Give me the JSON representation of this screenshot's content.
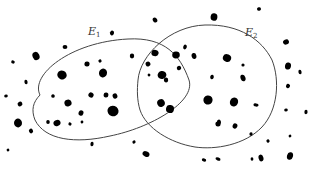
{
  "diagram": {
    "type": "venn-scatter",
    "sets": [
      {
        "id": "E1",
        "label_main": "E",
        "label_sub": "1",
        "label_pos": [
          88,
          26
        ]
      },
      {
        "id": "E2",
        "label_main": "E",
        "label_sub": "2",
        "label_pos": [
          245,
          27
        ]
      }
    ],
    "colors": {
      "background": "#ffffff",
      "curve": "#444444",
      "dot": "#000000",
      "label": "#333333"
    },
    "dots": [
      [
        155,
        20,
        2.2,
        2.6
      ],
      [
        214,
        17,
        3.4,
        3.8
      ],
      [
        259,
        9,
        2,
        1.8
      ],
      [
        112,
        33,
        2,
        2.4
      ],
      [
        65,
        47,
        2.4,
        2.0
      ],
      [
        36,
        56,
        3.4,
        4.2
      ],
      [
        13,
        62,
        1.8,
        1.6
      ],
      [
        26,
        82,
        1.6,
        2.2
      ],
      [
        62,
        75,
        4.8,
        4.4
      ],
      [
        87,
        64,
        2.6,
        2.6
      ],
      [
        100,
        61,
        1.6,
        1.6
      ],
      [
        103,
        73,
        4,
        4.4
      ],
      [
        6,
        96,
        1.8,
        1.6
      ],
      [
        20,
        104,
        2.4,
        2.4
      ],
      [
        53,
        96,
        1.8,
        1.8
      ],
      [
        68,
        103,
        3.6,
        3.4
      ],
      [
        81,
        113,
        2.4,
        2.8
      ],
      [
        48,
        122,
        1.8,
        2.0
      ],
      [
        57,
        123,
        3.6,
        3.0
      ],
      [
        70,
        124,
        1.6,
        1.6
      ],
      [
        82,
        122,
        1.4,
        1.4
      ],
      [
        91,
        95,
        2.6,
        2.6
      ],
      [
        106,
        95,
        2.4,
        2.6
      ],
      [
        115,
        96,
        2.4,
        2.6
      ],
      [
        113,
        111,
        5.6,
        5.2
      ],
      [
        18,
        123,
        4,
        4.4
      ],
      [
        31,
        131,
        2,
        2.4
      ],
      [
        92,
        144,
        1.6,
        2.2
      ],
      [
        134,
        142,
        1.6,
        1.6
      ],
      [
        146,
        154,
        3.6,
        2.6
      ],
      [
        132,
        56,
        2.2,
        2.4
      ],
      [
        148,
        64,
        2.4,
        2.4
      ],
      [
        155,
        53,
        3.6,
        3.2
      ],
      [
        162,
        75,
        4.4,
        4.0
      ],
      [
        149,
        75,
        1.4,
        1.4
      ],
      [
        166,
        80,
        2.2,
        2.4
      ],
      [
        179,
        68,
        2.2,
        2.2
      ],
      [
        185,
        47,
        1.8,
        2.4
      ],
      [
        176,
        55,
        3.8,
        3.4
      ],
      [
        161,
        103,
        3.8,
        3.8
      ],
      [
        170,
        109,
        4,
        4.0
      ],
      [
        194,
        56,
        2.4,
        3.0
      ],
      [
        227,
        58,
        4.2,
        3.8
      ],
      [
        243,
        65,
        1.6,
        1.6
      ],
      [
        243,
        78,
        2.4,
        3.4
      ],
      [
        212,
        77,
        1.8,
        2.2
      ],
      [
        208,
        100,
        4.6,
        4.6
      ],
      [
        234,
        102,
        4,
        4.6
      ],
      [
        256,
        105,
        2.6,
        1.6
      ],
      [
        219,
        122,
        2,
        2.4
      ],
      [
        235,
        126,
        2.4,
        2.6
      ],
      [
        218,
        124,
        2.6,
        2.6
      ],
      [
        286,
        42,
        3.0,
        2.6
      ],
      [
        288,
        66,
        3.0,
        3.6
      ],
      [
        300,
        72,
        1.6,
        2.2
      ],
      [
        288,
        86,
        2,
        2.2
      ],
      [
        306,
        112,
        1.6,
        2.2
      ],
      [
        290,
        136,
        1.4,
        1.4
      ],
      [
        290,
        156,
        3.0,
        3.8
      ],
      [
        286,
        110,
        1.8,
        1.6
      ],
      [
        268,
        141,
        1.6,
        1.6
      ],
      [
        251,
        134,
        1.6,
        1.8
      ],
      [
        261,
        158,
        2.4,
        3.4
      ],
      [
        218,
        159,
        2.6,
        1.6
      ],
      [
        252,
        159,
        1.4,
        1.8
      ],
      [
        8,
        150,
        1.4,
        1.4
      ],
      [
        204,
        160,
        2.2,
        1.6
      ]
    ]
  }
}
